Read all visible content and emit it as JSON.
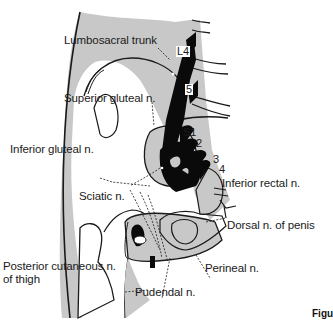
{
  "diagram": {
    "colors": {
      "bone_fill": "#c8c8c8",
      "nerve": "#0a0a0a",
      "outline": "#1a1a1a",
      "background": "#ffffff"
    },
    "root_labels": {
      "L4": "L4",
      "L5": "5",
      "S1": "S1",
      "S2": "2",
      "S3": "3",
      "S4": "4"
    },
    "labels": {
      "lumbosacral_trunk": "Lumbosacral trunk",
      "superior_gluteal": "Superior gluteal n.",
      "inferior_gluteal": "Inferior gluteal n.",
      "sciatic": "Sciatic n.",
      "posterior_cutaneous_line1": "Posterior cutaneous n.",
      "posterior_cutaneous_line2": "of thigh",
      "pudendal": "Pudendal n.",
      "perineal": "Perineal n.",
      "dorsal_penis": "Dorsal n. of penis",
      "inferior_rectal": "Inferior rectal  n."
    },
    "figure_caption_fragment": "Figu"
  }
}
